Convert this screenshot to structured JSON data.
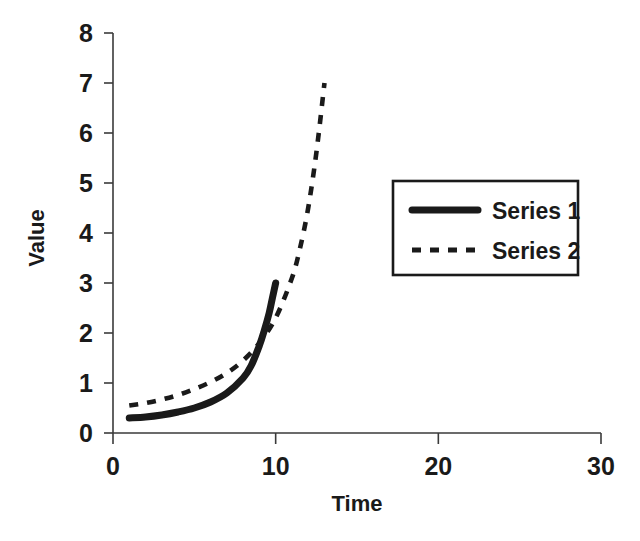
{
  "chart_data": {
    "type": "line",
    "title": "",
    "xlabel": "Time",
    "ylabel": "Value",
    "xlim": [
      0,
      30
    ],
    "ylim": [
      0,
      8
    ],
    "xticks": [
      0,
      10,
      20,
      30
    ],
    "yticks": [
      0,
      1,
      2,
      3,
      4,
      5,
      6,
      7,
      8
    ],
    "xtick_labels": [
      "0",
      "10",
      "20",
      "30"
    ],
    "ytick_labels": [
      "0",
      "1",
      "2",
      "3",
      "4",
      "5",
      "6",
      "7",
      "8"
    ],
    "grid": false,
    "legend_position": "upper right",
    "series": [
      {
        "name": "Series 1",
        "style": "solid",
        "color": "#1a1a1a",
        "x": [
          1,
          2,
          3,
          4,
          5,
          6,
          7,
          8,
          8.5,
          9,
          9.3,
          9.6,
          9.8,
          10
        ],
        "values": [
          0.3,
          0.32,
          0.36,
          0.42,
          0.5,
          0.62,
          0.8,
          1.1,
          1.35,
          1.75,
          2.05,
          2.4,
          2.7,
          3.0
        ]
      },
      {
        "name": "Series 2",
        "style": "dashed",
        "color": "#1a1a1a",
        "x": [
          1,
          2,
          3,
          4,
          5,
          6,
          7,
          8,
          9,
          10,
          11,
          11.5,
          12,
          12.5,
          13
        ],
        "values": [
          0.55,
          0.6,
          0.67,
          0.76,
          0.88,
          1.02,
          1.2,
          1.45,
          1.8,
          2.3,
          3.1,
          3.7,
          4.5,
          5.6,
          7.0
        ]
      }
    ]
  },
  "axes": {
    "y_label_text": "Value",
    "x_label_text": "Time"
  },
  "legend": {
    "entries": [
      {
        "label": "Series 1",
        "style": "solid"
      },
      {
        "label": "Series 2",
        "style": "dashed"
      }
    ]
  }
}
